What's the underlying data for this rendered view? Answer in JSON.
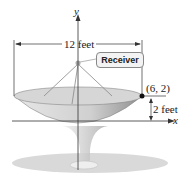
{
  "diagram": {
    "axes": {
      "y_label": "y",
      "x_label": "x"
    },
    "width_label": "12 feet",
    "depth_label": "2 feet",
    "point_label": "(6, 2)",
    "receiver_label": "Receiver",
    "colors": {
      "dish": "#c9c9c9",
      "dish_dark": "#9a9a9a",
      "ground": "#d8d8d8",
      "axis": "#333333",
      "point": "#111111"
    }
  }
}
